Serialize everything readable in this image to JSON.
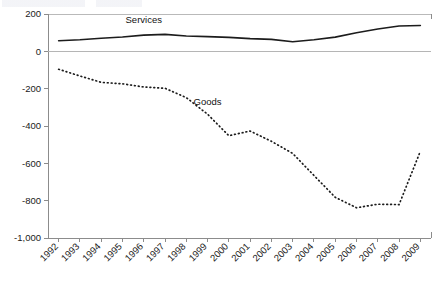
{
  "chart_data": {
    "type": "line",
    "title": "",
    "xlabel": "",
    "ylabel": "",
    "ylim": [
      -1000,
      200
    ],
    "grid": false,
    "legend_position": "inline-annotation",
    "categories": [
      "1992",
      "1993",
      "1994",
      "1995",
      "1996",
      "1997",
      "1998",
      "1999",
      "2000",
      "2001",
      "2002",
      "2003",
      "2004",
      "2005",
      "2006",
      "2007",
      "2008",
      "2009"
    ],
    "yticks": [
      "200",
      "0",
      "-200",
      "-400",
      "-600",
      "-800",
      "-1,000"
    ],
    "ytick_values": [
      200,
      0,
      -200,
      -400,
      -600,
      -800,
      -1000
    ],
    "series": [
      {
        "name": "Services",
        "style": "solid",
        "values": [
          57,
          62,
          70,
          77,
          87,
          91,
          82,
          79,
          75,
          68,
          64,
          51,
          62,
          76,
          100,
          120,
          136,
          138
        ]
      },
      {
        "name": "Goods",
        "style": "dotted",
        "values": [
          -96,
          -132,
          -166,
          -174,
          -191,
          -198,
          -248,
          -337,
          -452,
          -427,
          -482,
          -547,
          -665,
          -782,
          -838,
          -819,
          -821,
          -535
        ]
      }
    ],
    "annotations": [
      {
        "text": "Services",
        "series": "Services",
        "x": "1996",
        "value": 150
      },
      {
        "text": "Goods",
        "series": "Goods",
        "x": "1999",
        "value": -285
      }
    ]
  }
}
